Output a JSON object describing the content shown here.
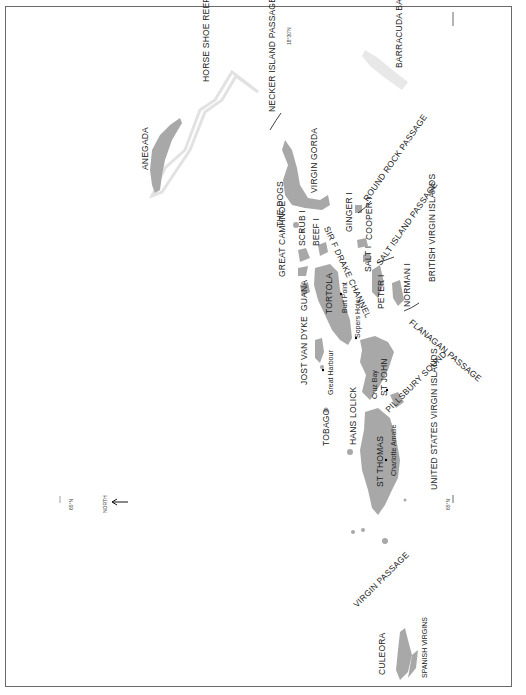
{
  "map": {
    "title": "British, US and Spanish Virgin Islands",
    "orientation": "rotated 90 degrees, north pointing left",
    "north_label": "NORTH",
    "latitude_marks": [
      "18°30'N",
      "65°N",
      "65°N"
    ],
    "regions": {
      "bvi": "BRITISH VIRGIN ISLANDS",
      "usvi": "UNITED STATES VIRGIN ISLANDS",
      "spanish": "SPANISH VIRGINS"
    },
    "islands": {
      "anegada": "ANEGADA",
      "virgin_gorda": "VIRGIN GORDA",
      "the_dogs": "THE DOGS",
      "great_camanoe": "GREAT CAMANOE",
      "scrub": "SCRUB I",
      "beef": "BEEF I",
      "guana": "GUANA",
      "tortola": "TORTOLA",
      "ginger": "GINGER I",
      "cooper": "COOPER I",
      "salt": "SALT I",
      "peter": "PETER I",
      "norman": "NORMAN I",
      "jost_van_dyke": "JOST VAN DYKE",
      "tobago": "TOBAGO",
      "hans_lolick": "HANS LOLICK",
      "st_john": "ST JOHN",
      "st_thomas": "ST THOMAS",
      "culebra": "CULEORA"
    },
    "places": {
      "burt_point": "Burt Point",
      "sopers_hole": "Sopers Hole",
      "great_harbour": "Great Harbour",
      "cruz_bay": "Cruz Bay",
      "charlotte_amalie": "Charlotte Amalie"
    },
    "water": {
      "horse_shoe_reef": "HORSE SHOE REEF",
      "barracuda_bank": "BARRACUDA BANK",
      "necker_passage": "NECKER ISLAND PASSAGE",
      "round_rock": "ROUND ROCK PASSAGE",
      "drake_channel": "SIR F DRAKE CHANNEL",
      "salt_passage": "SALT ISLAND PASSAGE",
      "flanagan": "FLANAGAN PASSAGE",
      "pillsbury": "PILLSBURY SOUND",
      "virgin_passage": "VIRGIN PASSAGE"
    },
    "colors": {
      "land": "#a8a8a8",
      "reef": "#e6e6e6",
      "frame": "#6a6a6a",
      "text": "#222222"
    }
  }
}
